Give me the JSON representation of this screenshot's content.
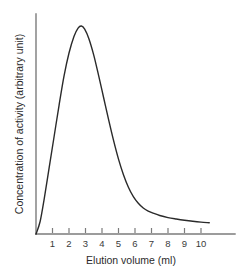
{
  "chart_data": {
    "type": "line",
    "title": "",
    "subtitle": "",
    "xlabel": "Elution volume (ml)",
    "ylabel": "Concentration of activity (arbitrary unit)",
    "xlim": [
      0,
      10.9
    ],
    "ylim": [
      0,
      1.05
    ],
    "xticks": [
      1,
      2,
      3,
      4,
      5,
      6,
      7,
      8,
      9,
      10
    ],
    "xtick_labels": [
      "1",
      "2",
      "3",
      "4",
      "5",
      "6",
      "7",
      "8",
      "9",
      "10"
    ],
    "yticks": [],
    "ytick_labels": [],
    "grid": false,
    "legend": null,
    "annotations": [],
    "series": [
      {
        "name": "Elution profile",
        "color": "#2a2a2a",
        "line_width": 1.4,
        "x": [
          0.0,
          0.25,
          0.5,
          0.8,
          1.1,
          1.4,
          1.7,
          2.0,
          2.3,
          2.55,
          2.75,
          2.95,
          3.2,
          3.5,
          3.8,
          4.1,
          4.4,
          4.7,
          5.0,
          5.3,
          5.6,
          5.9,
          6.2,
          6.5,
          6.8,
          7.1,
          7.5,
          8.0,
          8.5,
          9.0,
          9.5,
          10.0,
          10.5
        ],
        "y": [
          0.0,
          0.06,
          0.17,
          0.32,
          0.47,
          0.62,
          0.76,
          0.87,
          0.95,
          0.99,
          1.0,
          0.985,
          0.94,
          0.86,
          0.76,
          0.655,
          0.55,
          0.45,
          0.36,
          0.285,
          0.225,
          0.18,
          0.148,
          0.125,
          0.11,
          0.1,
          0.089,
          0.079,
          0.072,
          0.066,
          0.061,
          0.057,
          0.054
        ]
      }
    ],
    "peak": {
      "x": 2.75,
      "y": 1.0
    },
    "colors": {
      "curve": "#2a2a2a",
      "axis": "#7b7b7b",
      "tick": "#7b7b7b",
      "tick_label": "#3a3a3a",
      "axis_title": "#2b2b2b",
      "background": "#ffffff"
    }
  }
}
